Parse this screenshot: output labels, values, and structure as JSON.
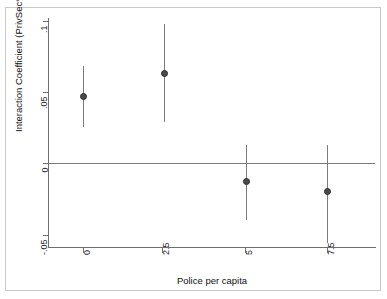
{
  "chart_data": {
    "type": "scatter",
    "title": "",
    "subtitle": "",
    "xlabel": "Police per capita",
    "ylabel": "Interaction Coefficient (PrivSec*PubPol)",
    "x": [
      0,
      2.5,
      5,
      7.5
    ],
    "values": [
      0.047,
      0.063,
      -0.013,
      -0.02
    ],
    "ci_lower": [
      0.025,
      0.029,
      -0.04,
      -0.056
    ],
    "ci_upper": [
      0.068,
      0.098,
      0.013,
      0.013
    ],
    "series": [
      {
        "name": "Interaction Coefficient (PrivSec*PubPol)",
        "values": [
          0.047,
          0.063,
          -0.013,
          -0.02
        ],
        "ci_lower": [
          0.025,
          0.029,
          -0.04,
          -0.056
        ],
        "ci_upper": [
          0.068,
          0.098,
          0.013,
          0.013
        ]
      }
    ],
    "xlim": [
      -0.9,
      8.4
    ],
    "ylim": [
      -0.058,
      0.102
    ],
    "xticks": [
      0,
      2.5,
      5,
      7.5
    ],
    "xtick_labels": [
      "0",
      "2.5",
      "5",
      "7.5"
    ],
    "yticks": [
      0.1,
      0.05,
      0,
      -0.05
    ],
    "ytick_labels": [
      ".1",
      ".05",
      "0",
      "-.05"
    ],
    "grid": false,
    "legend": null,
    "reference_line": 0,
    "marker_color": "#4a4a4a",
    "ci_color": "#7b7b7b",
    "axis_color": "#6f6f6f",
    "background": "#ffffff"
  },
  "axes": {
    "y_title": "Interaction Coefficient (PrivSec*PubPol)",
    "x_title": "Police per capita",
    "y_labels": [
      ".1",
      ".05",
      "0",
      "-.05"
    ],
    "x_labels": [
      "0",
      "2.5",
      "5",
      "7.5"
    ]
  }
}
